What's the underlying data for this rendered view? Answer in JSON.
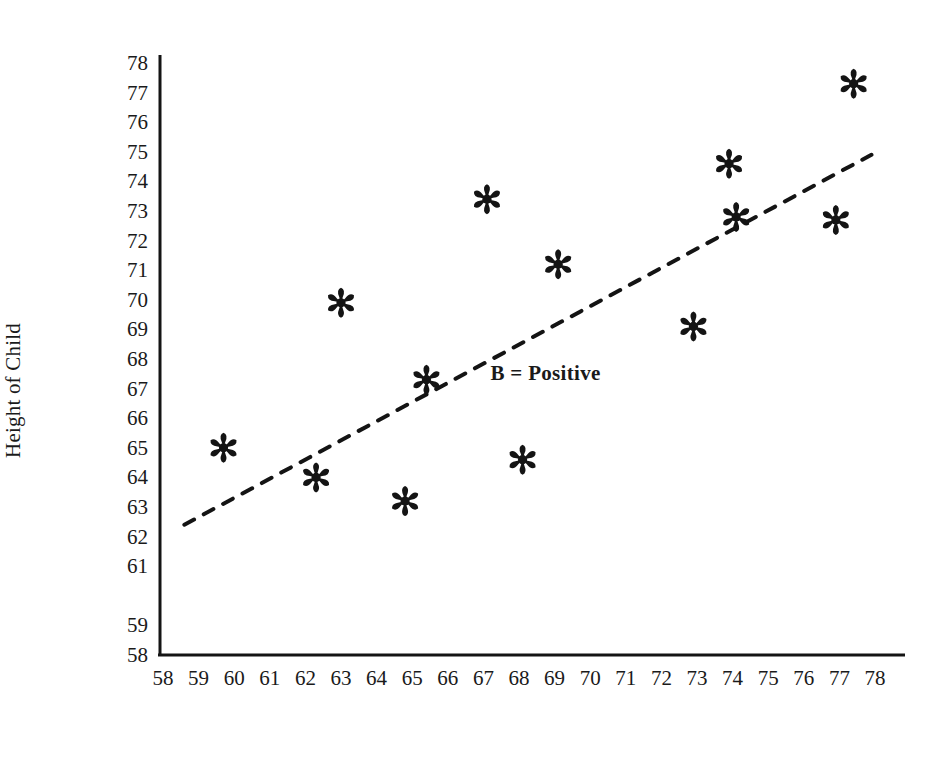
{
  "chart_data": {
    "type": "scatter",
    "title": "",
    "xlabel": "Average Height of Genetic Parents (inches)",
    "ylabel": "Height of Child",
    "xlim": [
      58,
      78
    ],
    "ylim": [
      58,
      78
    ],
    "grid": false,
    "legend": "none",
    "x_ticks": [
      "58",
      "59",
      "60",
      "61",
      "62",
      "63",
      "64",
      "65",
      "66",
      "67",
      "68",
      "69",
      "70",
      "71",
      "72",
      "73",
      "74",
      "75",
      "76",
      "77",
      "78"
    ],
    "y_ticks": [
      "78",
      "77",
      "76",
      "75",
      "74",
      "73",
      "72",
      "71",
      "70",
      "69",
      "68",
      "67",
      "66",
      "65",
      "64",
      "63",
      "62",
      "61",
      "59",
      "58"
    ],
    "marker": "asterisk",
    "marker_color": "#141414",
    "points": [
      {
        "x": 59.7,
        "y": 65.0
      },
      {
        "x": 62.3,
        "y": 64.0
      },
      {
        "x": 63.0,
        "y": 69.9
      },
      {
        "x": 64.8,
        "y": 63.2
      },
      {
        "x": 65.4,
        "y": 67.3
      },
      {
        "x": 67.1,
        "y": 73.4
      },
      {
        "x": 68.1,
        "y": 64.6
      },
      {
        "x": 69.1,
        "y": 71.2
      },
      {
        "x": 72.9,
        "y": 69.1
      },
      {
        "x": 73.9,
        "y": 74.6
      },
      {
        "x": 74.1,
        "y": 72.8
      },
      {
        "x": 76.9,
        "y": 72.7
      },
      {
        "x": 77.4,
        "y": 77.3
      }
    ],
    "trend_line": {
      "style": "dashed",
      "color": "#141414",
      "x_start": 58.6,
      "y_start": 62.4,
      "x_end": 77.9,
      "y_end": 74.9
    },
    "annotations": [
      {
        "text": "B = Positive",
        "x": 67.2,
        "y": 67.5
      }
    ],
    "axis_color": "#141414"
  }
}
